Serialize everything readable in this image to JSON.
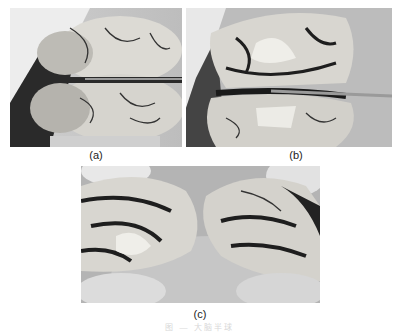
{
  "figure": {
    "panels": [
      {
        "id": "a",
        "label": "(a)",
        "description": "Brain specimen top view with a metal rod placed across the longitudinal fissure between hemispheres, held by gloved hands"
      },
      {
        "id": "b",
        "label": "(b)",
        "description": "Brain specimen partially separated along the midline with metal rod inserted, showing internal structures"
      },
      {
        "id": "c",
        "label": "(c)",
        "description": "Two brain hemispheres separated, medial surfaces facing each other, resting on gloved hands"
      }
    ],
    "caption": "图 — 大脑半球"
  },
  "colors": {
    "background": "#ffffff",
    "glove": "#d9d9d9",
    "tissue_light": "#e6e4df",
    "tissue_dark": "#1e1e1e",
    "backdrop": "#a8a8a8",
    "rod": "#8c8c8c"
  }
}
